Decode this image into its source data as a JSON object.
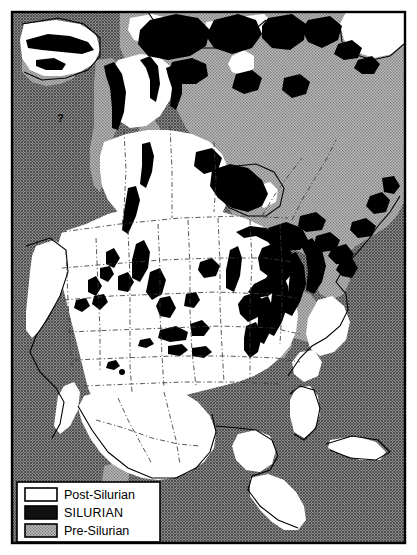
{
  "figure": {
    "kind": "geologic-map",
    "frame": {
      "border_color": "#000000",
      "background_color": "#ffffff"
    }
  },
  "colors": {
    "post_silurian": "#ffffff",
    "silurian": "#111111",
    "pre_silurian": "#a8a8a8",
    "ocean": "#6e6e6e",
    "outline": "#000000",
    "state_border": "#333333"
  },
  "legend": {
    "box_fill": "#ffffff",
    "box_stroke": "#000000",
    "items": [
      {
        "label": "Post-Silurian",
        "swatch": "post_silurian",
        "caps": false
      },
      {
        "label": "SILURIAN",
        "swatch": "silurian",
        "caps": true
      },
      {
        "label": "Pre-Silurian",
        "swatch": "pre_silurian",
        "caps": false
      }
    ]
  },
  "annotations": {
    "query_marks": [
      "?",
      "?"
    ]
  },
  "regions": {
    "land_areas": [
      "Alaska",
      "Yukon",
      "British Columbia",
      "Canadian Shield",
      "Arctic Archipelago",
      "Greenland margin",
      "Conterminous United States",
      "Mexico",
      "Central America",
      "Cuba",
      "Florida peninsula"
    ],
    "water_bodies": [
      "Pacific Ocean",
      "Arctic Ocean",
      "Atlantic Ocean",
      "Gulf of Mexico",
      "Hudson Bay",
      "Caribbean Sea",
      "Great Lakes"
    ]
  }
}
